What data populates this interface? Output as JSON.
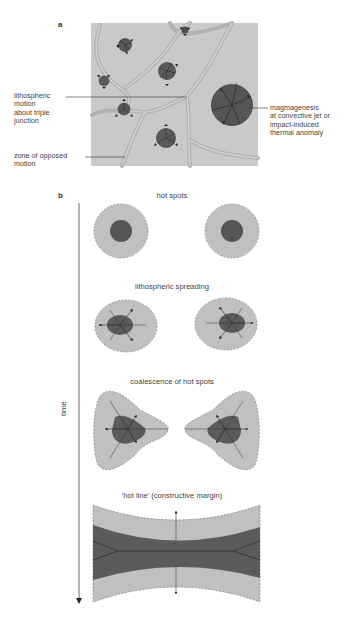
{
  "panel_a": {
    "letter": "a",
    "labels": {
      "triple_junction": "lithospheric\nmotion\nabout triple\njunction",
      "opposed_motion": "zone of opposed\nmotion",
      "magmagenesis": "magmagenesis\nat convective jet or\nimpact-induced\nthermal anomaly"
    }
  },
  "panel_b": {
    "letter": "b",
    "axis_label": "time",
    "stages": [
      {
        "title": "hot spots"
      },
      {
        "title": "lithospheric spreading"
      },
      {
        "title": "coalescence of hot spots"
      },
      {
        "title": "'hot line' (constructive margin)"
      }
    ]
  },
  "colors": {
    "background_gray": "#c8c8c8",
    "light_fill": "#bdbdbd",
    "dark_fill": "#5e5e5e",
    "band_line": "#a9a9a9",
    "outline": "#7a7a7a"
  }
}
